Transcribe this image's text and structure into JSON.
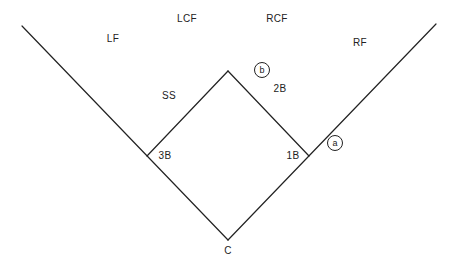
{
  "diagram": {
    "type": "baseball-field-positions",
    "stroke_color": "#222222",
    "background": "#ffffff",
    "positions": {
      "lf": "LF",
      "lcf": "LCF",
      "rcf": "RCF",
      "rf": "RF",
      "ss": "SS",
      "second_base": "2B",
      "third_base": "3B",
      "first_base": "1B",
      "catcher": "C"
    },
    "markers": {
      "a": "a",
      "b": "b"
    }
  }
}
